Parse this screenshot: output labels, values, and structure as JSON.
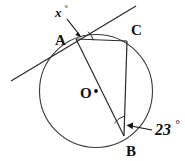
{
  "figure": {
    "kind": "circle-geometry-diagram",
    "background_color": "#ffffff",
    "ink_color": "#2a2a2a",
    "labels": {
      "point_a": "A",
      "point_b": "B",
      "point_c": "C",
      "center_o": "O",
      "angle_x_value": "x",
      "angle_x_degree_symbol": "°",
      "angle_23_value": "23",
      "angle_23_degree_symbol": "°"
    },
    "geometry": {
      "circle": {
        "cx": 96,
        "cy": 91,
        "r": 56.5
      },
      "points": {
        "A": {
          "x": 76,
          "y": 39
        },
        "B": {
          "x": 124,
          "y": 136
        },
        "C": {
          "x": 127,
          "y": 41
        },
        "O": {
          "x": 96,
          "y": 91
        }
      },
      "tangent_line": {
        "x1": 11,
        "y1": 81,
        "x2": 136,
        "y2": 6
      },
      "chords": [
        {
          "from": "A",
          "to": "C"
        },
        {
          "from": "C",
          "to": "B"
        },
        {
          "from": "A",
          "to": "B"
        }
      ],
      "diameter": {
        "from": "A",
        "through": "O",
        "to": "B"
      },
      "marked_angles": [
        {
          "name": "x",
          "vertex": "A",
          "between": [
            "tangent",
            "AC"
          ]
        },
        {
          "name": "23",
          "vertex": "B",
          "between": [
            "BC",
            "BA"
          ]
        }
      ]
    }
  }
}
